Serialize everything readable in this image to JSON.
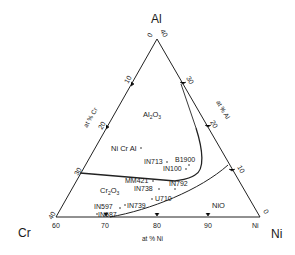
{
  "diagram": {
    "type": "ternary-phase-diagram",
    "corners": {
      "top": "Al",
      "left": "Cr",
      "right": "Ni"
    },
    "axis_titles": {
      "left": "at % Cr",
      "right": "at % Al",
      "bottom": "at % Ni"
    },
    "bottom_ticks": [
      "60",
      "70",
      "80",
      "90",
      "Ni"
    ],
    "left_ticks": [
      "0",
      "10",
      "20",
      "30",
      "40"
    ],
    "right_ticks": [
      "40",
      "30",
      "20",
      "10",
      "0"
    ],
    "phase_regions": [
      "Al2O3",
      "Ni Cr Al",
      "Cr2O3",
      "NiO"
    ],
    "alloys": [
      "B1900",
      "IN713",
      "IN100",
      "MM421",
      "IN792",
      "IN738",
      "U710",
      "IN597",
      "IN739",
      "IN587"
    ]
  }
}
